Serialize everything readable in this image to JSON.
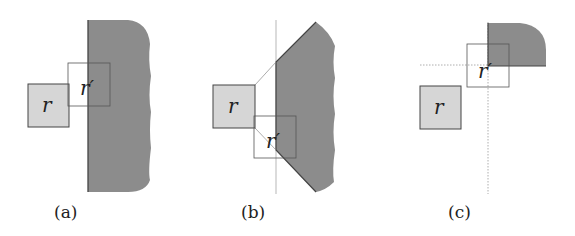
{
  "figure": {
    "panels": [
      {
        "id": "a",
        "caption": "(a)",
        "box_r_label": "r",
        "box_r_prime_label": "r′"
      },
      {
        "id": "b",
        "caption": "(b)",
        "box_r_label": "r",
        "box_r_prime_label": "r′"
      },
      {
        "id": "c",
        "caption": "(c)",
        "box_r_label": "r",
        "box_r_prime_label": "r′"
      }
    ],
    "colors": {
      "region_fill": "#8c8c8c",
      "box_r_fill": "#d6d6d6",
      "outline": "#444444",
      "guide_line": "#999999"
    }
  }
}
